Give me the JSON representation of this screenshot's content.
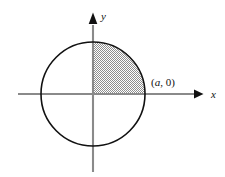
{
  "figure": {
    "background_color": "#ffffff",
    "width": 225,
    "height": 177
  },
  "axes": {
    "x": {
      "label": "x",
      "color": "#8a8a8a",
      "arrow_color": "#111111",
      "start_x": 18,
      "end_x": 202,
      "y": 94,
      "label_x": 211,
      "label_y": 98
    },
    "y": {
      "label": "y",
      "color": "#8a8a8a",
      "arrow_color": "#111111",
      "start_y": 172,
      "end_y": 20,
      "x": 93,
      "label_x": 101,
      "label_y": 20
    },
    "origin": {
      "x": 93,
      "y": 94
    }
  },
  "circle": {
    "center_x": 93,
    "center_y": 94,
    "radius": 52,
    "stroke_color": "#111111",
    "stroke_width": 1.6,
    "fill": "none"
  },
  "shaded_region": {
    "description": "quarter disk in the first quadrant",
    "pattern": "checkerboard-gray",
    "pattern_color": "#8e8e8e",
    "pattern_background": "#ffffff",
    "quadrant": 1
  },
  "labels": {
    "point_a": {
      "full_text": "(a, 0)",
      "open_paren": "(",
      "variable": "a",
      "separator": ", ",
      "value": "0",
      "close_paren": ")",
      "x": 151,
      "y": 86
    }
  }
}
